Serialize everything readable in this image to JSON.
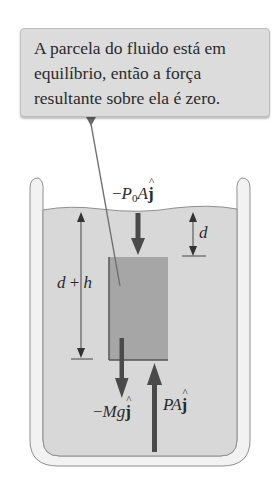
{
  "callout": {
    "lines": [
      "A parcela do fluido está em",
      "equilíbrio, então a força",
      "resultante sobre ela é zero."
    ]
  },
  "labels": {
    "top_force": {
      "sign": "−",
      "symbol": "P",
      "subscript": "0",
      "area": "A",
      "unit": "j",
      "hat": "^"
    },
    "weight_force": {
      "sign": "−",
      "symbol": "Mg",
      "unit": "j",
      "hat": "^"
    },
    "bottom_force": {
      "symbol": "PA",
      "unit": "j",
      "hat": "^"
    },
    "depth_d": "d",
    "depth_dh": {
      "a": "d",
      "op": "+",
      "b": "h"
    }
  },
  "colors": {
    "fluid": "#d8d8d8",
    "block": "#a6a6a6",
    "beaker_wall": "#f2f2f2",
    "beaker_stroke": "#8a8a8a",
    "arrow": "#4a4a4a",
    "callout_fill": "#dcdcdc"
  }
}
